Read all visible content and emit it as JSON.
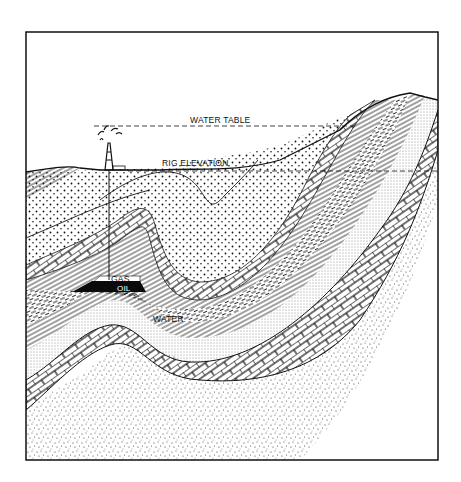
{
  "diagram": {
    "labels": {
      "water_table": "WATER TABLE",
      "rig_elevation": "RIG ELEVATION",
      "gas": "GAS",
      "oil": "OIL",
      "water": "WATER"
    },
    "colors": {
      "ink": "#111111",
      "paper": "#ffffff",
      "oil": "#0a0a0a"
    },
    "elements": [
      "drilling-rig-with-gusher",
      "water-table-dashed-line",
      "rig-elevation-dashed-line",
      "surface-topography",
      "dotted-sandstone-layers",
      "brick-limestone-layers",
      "thin-laminated-shale-layers",
      "dashed-shale-layer",
      "stippled-sand-layer",
      "speckled-basement",
      "gas-cap",
      "oil-reservoir",
      "water-zone",
      "well-bore"
    ]
  }
}
